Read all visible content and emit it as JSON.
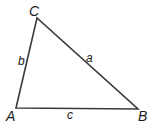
{
  "diagram": {
    "type": "triangle",
    "stroke_color": "#3a3a3a",
    "vertices": {
      "A": {
        "label": "A",
        "x": 16,
        "y": 108
      },
      "B": {
        "label": "B",
        "x": 138,
        "y": 109
      },
      "C": {
        "label": "C",
        "x": 37,
        "y": 18
      }
    },
    "sides": {
      "a": {
        "label": "a",
        "between": "B-C"
      },
      "b": {
        "label": "b",
        "between": "A-C"
      },
      "c": {
        "label": "c",
        "between": "A-B"
      }
    }
  }
}
